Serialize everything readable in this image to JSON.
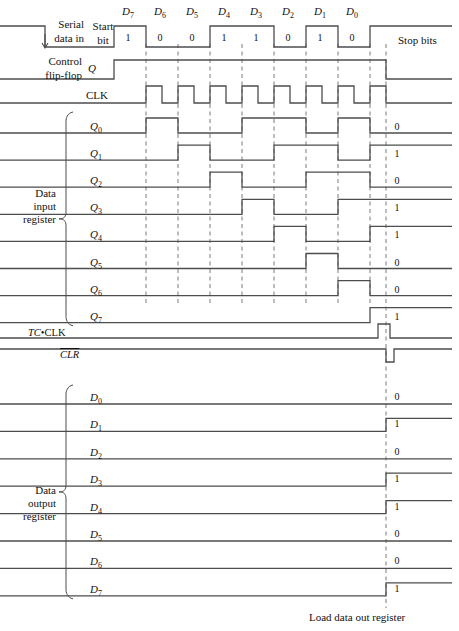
{
  "diagram": {
    "line_color": "#4d4d4d",
    "dash_color": "#7a7a7a",
    "text_color": "#111111"
  },
  "geometry": {
    "axis_start_x": 114,
    "bit_width": 32,
    "first_edge_x": 146,
    "load_x": 386,
    "right_x": 452
  },
  "serial": {
    "label_line1": "Serial",
    "label_line2": "data in",
    "start_bit_l1": "Start",
    "start_bit_l2": "bit",
    "stop_bits": "Stop bits",
    "bit_names": [
      "D7",
      "D6",
      "D5",
      "D4",
      "D3",
      "D2",
      "D1",
      "D0"
    ],
    "bit_name_base": [
      "D",
      "D",
      "D",
      "D",
      "D",
      "D",
      "D",
      "D"
    ],
    "bit_name_sub": [
      "7",
      "6",
      "5",
      "4",
      "3",
      "2",
      "1",
      "0"
    ],
    "bit_values": [
      "1",
      "0",
      "0",
      "1",
      "1",
      "0",
      "1",
      "0"
    ]
  },
  "control": {
    "label_line1": "Control",
    "label_line2": "flip-flop",
    "signal": "Q"
  },
  "clock": {
    "label": "CLK"
  },
  "input_register": {
    "group_label_l1": "Data",
    "group_label_l2": "input",
    "group_label_l3": "register",
    "rows": [
      {
        "base": "Q",
        "sub": "0",
        "final": "0"
      },
      {
        "base": "Q",
        "sub": "1",
        "final": "1"
      },
      {
        "base": "Q",
        "sub": "2",
        "final": "0"
      },
      {
        "base": "Q",
        "sub": "3",
        "final": "1"
      },
      {
        "base": "Q",
        "sub": "4",
        "final": "1"
      },
      {
        "base": "Q",
        "sub": "5",
        "final": "0"
      },
      {
        "base": "Q",
        "sub": "6",
        "final": "0"
      },
      {
        "base": "Q",
        "sub": "7",
        "final": "1"
      }
    ]
  },
  "tc_clk": {
    "label_italic": "TC",
    "label_dot": "•",
    "label_rest": "CLK"
  },
  "clr": {
    "label": "CLR"
  },
  "output_register": {
    "group_label_l1": "Data",
    "group_label_l2": "output",
    "group_label_l3": "register",
    "rows": [
      {
        "base": "D",
        "sub": "0",
        "final": "0"
      },
      {
        "base": "D",
        "sub": "1",
        "final": "1"
      },
      {
        "base": "D",
        "sub": "2",
        "final": "0"
      },
      {
        "base": "D",
        "sub": "3",
        "final": "1"
      },
      {
        "base": "D",
        "sub": "4",
        "final": "1"
      },
      {
        "base": "D",
        "sub": "5",
        "final": "0"
      },
      {
        "base": "D",
        "sub": "6",
        "final": "0"
      },
      {
        "base": "D",
        "sub": "7",
        "final": "1"
      }
    ]
  },
  "footer": {
    "load_caption": "Load data out register"
  },
  "chart_data": {
    "type": "line",
    "xlabel": "time",
    "ylabel": "logic level",
    "grid": "vertical dashed lines at clock rising edges",
    "legend": "none",
    "time_marks": {
      "clock_edges_x": [
        146,
        178,
        210,
        242,
        274,
        306,
        338,
        370
      ],
      "load_edge_x": 386
    },
    "signals": [
      {
        "name": "Serial data in",
        "final": null,
        "transitions": [
          [
            0,
            1
          ],
          [
            45,
            0
          ],
          [
            114,
            1
          ],
          [
            146,
            0
          ],
          [
            210,
            1
          ],
          [
            274,
            0
          ],
          [
            306,
            1
          ],
          [
            338,
            0
          ],
          [
            370,
            1
          ]
        ]
      },
      {
        "name": "Control flip-flop Q",
        "final": null,
        "transitions": [
          [
            0,
            0
          ],
          [
            114,
            1
          ],
          [
            386,
            0
          ]
        ]
      },
      {
        "name": "CLK",
        "final": null,
        "transitions": [
          [
            0,
            0
          ],
          [
            146,
            1
          ],
          [
            162,
            0
          ],
          [
            178,
            1
          ],
          [
            194,
            0
          ],
          [
            210,
            1
          ],
          [
            226,
            0
          ],
          [
            242,
            1
          ],
          [
            258,
            0
          ],
          [
            274,
            1
          ],
          [
            290,
            0
          ],
          [
            306,
            1
          ],
          [
            322,
            0
          ],
          [
            338,
            1
          ],
          [
            354,
            0
          ],
          [
            370,
            1
          ],
          [
            386,
            0
          ]
        ]
      },
      {
        "name": "Q0",
        "final": "0",
        "transitions": [
          [
            0,
            0
          ],
          [
            146,
            1
          ],
          [
            178,
            0
          ],
          [
            242,
            1
          ],
          [
            306,
            0
          ],
          [
            338,
            1
          ],
          [
            370,
            0
          ]
        ]
      },
      {
        "name": "Q1",
        "final": "1",
        "transitions": [
          [
            0,
            0
          ],
          [
            178,
            1
          ],
          [
            210,
            0
          ],
          [
            274,
            1
          ],
          [
            338,
            0
          ],
          [
            370,
            1
          ]
        ]
      },
      {
        "name": "Q2",
        "final": "0",
        "transitions": [
          [
            0,
            0
          ],
          [
            210,
            1
          ],
          [
            242,
            0
          ],
          [
            306,
            1
          ],
          [
            370,
            0
          ]
        ]
      },
      {
        "name": "Q3",
        "final": "1",
        "transitions": [
          [
            0,
            0
          ],
          [
            242,
            1
          ],
          [
            274,
            0
          ],
          [
            338,
            1
          ]
        ]
      },
      {
        "name": "Q4",
        "final": "1",
        "transitions": [
          [
            0,
            0
          ],
          [
            274,
            1
          ],
          [
            306,
            0
          ],
          [
            370,
            1
          ]
        ]
      },
      {
        "name": "Q5",
        "final": "0",
        "transitions": [
          [
            0,
            0
          ],
          [
            306,
            1
          ],
          [
            338,
            0
          ]
        ]
      },
      {
        "name": "Q6",
        "final": "0",
        "transitions": [
          [
            0,
            0
          ],
          [
            338,
            1
          ],
          [
            370,
            0
          ]
        ]
      },
      {
        "name": "Q7",
        "final": "1",
        "transitions": [
          [
            0,
            0
          ],
          [
            370,
            1
          ]
        ]
      },
      {
        "name": "TC•CLK",
        "final": null,
        "transitions": [
          [
            0,
            0
          ],
          [
            378,
            1
          ],
          [
            390,
            0
          ]
        ]
      },
      {
        "name": "CLR",
        "final": null,
        "transitions": [
          [
            0,
            1
          ],
          [
            386,
            0
          ],
          [
            394,
            1
          ]
        ]
      },
      {
        "name": "D0",
        "final": "0",
        "transitions": [
          [
            0,
            0
          ]
        ]
      },
      {
        "name": "D1",
        "final": "1",
        "transitions": [
          [
            0,
            0
          ],
          [
            386,
            1
          ]
        ]
      },
      {
        "name": "D2",
        "final": "0",
        "transitions": [
          [
            0,
            0
          ]
        ]
      },
      {
        "name": "D3",
        "final": "1",
        "transitions": [
          [
            0,
            0
          ],
          [
            386,
            1
          ]
        ]
      },
      {
        "name": "D4",
        "final": "1",
        "transitions": [
          [
            0,
            0
          ],
          [
            386,
            1
          ]
        ]
      },
      {
        "name": "D5",
        "final": "0",
        "transitions": [
          [
            0,
            0
          ]
        ]
      },
      {
        "name": "D6",
        "final": "0",
        "transitions": [
          [
            0,
            0
          ]
        ]
      },
      {
        "name": "D7",
        "final": "1",
        "transitions": [
          [
            0,
            0
          ],
          [
            386,
            1
          ]
        ]
      }
    ]
  }
}
